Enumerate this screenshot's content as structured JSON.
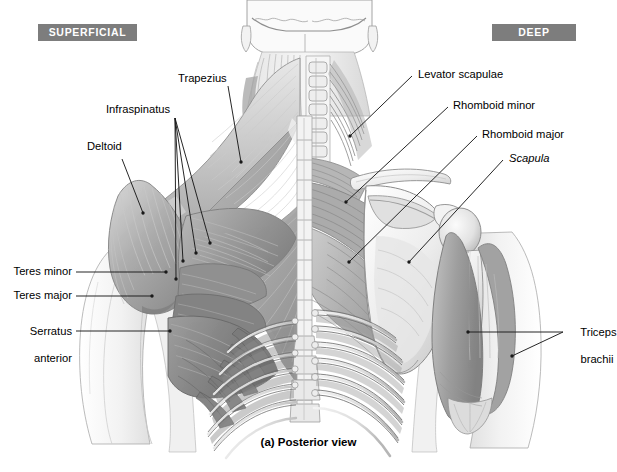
{
  "figure": {
    "caption": "(a) Posterior view",
    "view": "Posterior view",
    "background_color": "#ffffff",
    "badge_color": "#7d7d7d",
    "badge_text_color": "#ffffff",
    "leader_color": "#1a1a1a"
  },
  "badges": {
    "left": "SUPERFICIAL",
    "right": "DEEP"
  },
  "labels": {
    "trapezius": "Trapezius",
    "infraspinatus": "Infraspinatus",
    "deltoid": "Deltoid",
    "teres_minor": "Teres minor",
    "teres_major": "Teres major",
    "serratus_anterior_l1": "Serratus",
    "serratus_anterior_l2": "anterior",
    "levator_scapulae": "Levator scapulae",
    "rhomboid_minor": "Rhomboid minor",
    "rhomboid_major": "Rhomboid major",
    "scapula": "Scapula",
    "triceps_brachii_l1": "Triceps",
    "triceps_brachii_l2": "brachii"
  },
  "structures": [
    {
      "name": "Trapezius",
      "type": "muscle",
      "side": "superficial"
    },
    {
      "name": "Infraspinatus",
      "type": "muscle",
      "side": "superficial"
    },
    {
      "name": "Deltoid",
      "type": "muscle",
      "side": "superficial"
    },
    {
      "name": "Teres minor",
      "type": "muscle",
      "side": "superficial"
    },
    {
      "name": "Teres major",
      "type": "muscle",
      "side": "superficial"
    },
    {
      "name": "Serratus anterior",
      "type": "muscle",
      "side": "superficial"
    },
    {
      "name": "Levator scapulae",
      "type": "muscle",
      "side": "deep"
    },
    {
      "name": "Rhomboid minor",
      "type": "muscle",
      "side": "deep"
    },
    {
      "name": "Rhomboid major",
      "type": "muscle",
      "side": "deep"
    },
    {
      "name": "Scapula",
      "type": "bone",
      "side": "deep"
    },
    {
      "name": "Triceps brachii",
      "type": "muscle",
      "side": "deep"
    }
  ]
}
